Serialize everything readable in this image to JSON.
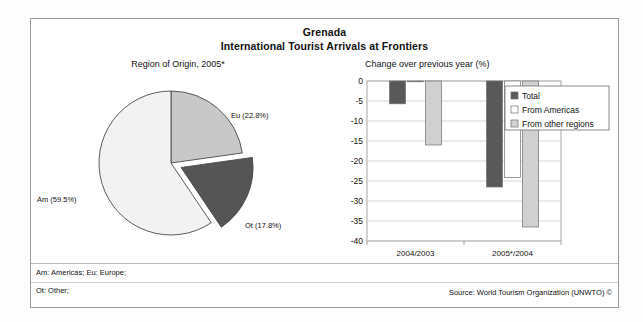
{
  "header": {
    "country": "Grenada",
    "subtitle": "International Tourist Arrivals at Frontiers"
  },
  "pie_caption": "Region of Origin, 2005*",
  "bar_caption": "Change over previous year (%)",
  "pie_labels": {
    "eu": "Eu (22.8%)",
    "ot": "Ot (17.8%)",
    "am": "Am (59.5%)"
  },
  "axis": {
    "y_ticks": [
      "0",
      "-5",
      "-10",
      "-15",
      "-20",
      "-25",
      "-30",
      "-35",
      "-40"
    ],
    "x_ticks": [
      "2004/2003",
      "2005*/2004"
    ]
  },
  "legend": {
    "items": [
      {
        "label": "Total",
        "color": "#595959"
      },
      {
        "label": "From Americas",
        "color": "#ffffff"
      },
      {
        "label": "From other regions",
        "color": "#d0d0d0"
      }
    ]
  },
  "footer": {
    "abbr_line1": "Am: Americas; Eu: Europe;",
    "abbr_line2": "Ot: Other;",
    "source": "Source: World Tourism Organization (UNWTO) ©"
  },
  "colors": {
    "total": "#595959",
    "americas": "#ffffff",
    "other_regions": "#d0d0d0",
    "pie_eu": "#c8c8c8",
    "pie_ot": "#555555",
    "pie_am": "#f2f2f2",
    "stroke": "#4a4a4a",
    "grid": "#c4c4c4",
    "frame": "#9a9a9a"
  },
  "chart_data": [
    {
      "type": "pie",
      "title": "Region of Origin, 2005*",
      "labels": [
        "Eu",
        "Ot",
        "Am"
      ],
      "label_texts": [
        "Eu (22.8%)",
        "Ot (17.8%)",
        "Am (59.5%)"
      ],
      "values": [
        22.8,
        17.8,
        59.5
      ],
      "units": "%",
      "exploded_slice": "Ot",
      "start_angle_deg": 0,
      "direction": "clockwise",
      "slice_colors": [
        "#c8c8c8",
        "#555555",
        "#f2f2f2"
      ]
    },
    {
      "type": "bar",
      "title": "Change over previous year (%)",
      "xlabel": "",
      "ylabel": "",
      "ylim": [
        -40,
        0
      ],
      "ytick_step": 5,
      "grid": true,
      "legend_position": "top-right",
      "categories": [
        "2004/2003",
        "2005*/2004"
      ],
      "series": [
        {
          "name": "Total",
          "values": [
            -5.7,
            -26.5
          ],
          "color": "#595959"
        },
        {
          "name": "From Americas",
          "values": [
            -0.2,
            -24.1
          ],
          "color": "#ffffff"
        },
        {
          "name": "From other regions",
          "values": [
            -16.0,
            -36.5
          ],
          "color": "#d0d0d0"
        }
      ]
    }
  ]
}
